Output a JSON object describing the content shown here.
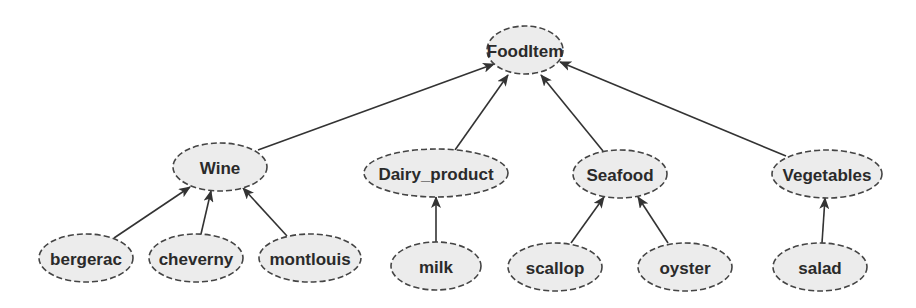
{
  "diagram": {
    "type": "class-hierarchy",
    "nodes": [
      {
        "id": "FoodItem",
        "label": "FoodItem",
        "cx": 525,
        "cy": 50,
        "rx": 38,
        "ry": 24
      },
      {
        "id": "Wine",
        "label": "Wine",
        "cx": 220,
        "cy": 167,
        "rx": 47,
        "ry": 24
      },
      {
        "id": "Dairy_product",
        "label": "Dairy_product",
        "cx": 436,
        "cy": 173,
        "rx": 72,
        "ry": 24
      },
      {
        "id": "Seafood",
        "label": "Seafood",
        "cx": 620,
        "cy": 174,
        "rx": 47,
        "ry": 24
      },
      {
        "id": "Vegetables",
        "label": "Vegetables",
        "cx": 827,
        "cy": 174,
        "rx": 55,
        "ry": 24
      },
      {
        "id": "bergerac",
        "label": "bergerac",
        "cx": 86,
        "cy": 258,
        "rx": 47,
        "ry": 24
      },
      {
        "id": "cheverny",
        "label": "cheverny",
        "cx": 196,
        "cy": 258,
        "rx": 47,
        "ry": 24
      },
      {
        "id": "montlouis",
        "label": "montlouis",
        "cx": 310,
        "cy": 258,
        "rx": 51,
        "ry": 24
      },
      {
        "id": "milk",
        "label": "milk",
        "cx": 436,
        "cy": 266,
        "rx": 45,
        "ry": 24
      },
      {
        "id": "scallop",
        "label": "scallop",
        "cx": 555,
        "cy": 267,
        "rx": 47,
        "ry": 24
      },
      {
        "id": "oyster",
        "label": "oyster",
        "cx": 685,
        "cy": 267,
        "rx": 47,
        "ry": 24
      },
      {
        "id": "salad",
        "label": "salad",
        "cx": 820,
        "cy": 267,
        "rx": 47,
        "ry": 24
      }
    ],
    "edges": [
      {
        "from": "Wine",
        "to": "FoodItem",
        "x1": 258,
        "y1": 150,
        "x2": 494,
        "y2": 64
      },
      {
        "from": "Dairy_product",
        "to": "FoodItem",
        "x1": 455,
        "y1": 150,
        "x2": 508,
        "y2": 75
      },
      {
        "from": "Seafood",
        "to": "FoodItem",
        "x1": 603,
        "y1": 151,
        "x2": 541,
        "y2": 75
      },
      {
        "from": "Vegetables",
        "to": "FoodItem",
        "x1": 786,
        "y1": 156,
        "x2": 560,
        "y2": 62
      },
      {
        "from": "bergerac",
        "to": "Wine",
        "x1": 114,
        "y1": 238,
        "x2": 190,
        "y2": 187
      },
      {
        "from": "cheverny",
        "to": "Wine",
        "x1": 201,
        "y1": 234,
        "x2": 211,
        "y2": 191
      },
      {
        "from": "montlouis",
        "to": "Wine",
        "x1": 287,
        "y1": 236,
        "x2": 243,
        "y2": 188
      },
      {
        "from": "milk",
        "to": "Dairy_product",
        "x1": 436,
        "y1": 242,
        "x2": 436,
        "y2": 197
      },
      {
        "from": "scallop",
        "to": "Seafood",
        "x1": 571,
        "y1": 243,
        "x2": 604,
        "y2": 197
      },
      {
        "from": "oyster",
        "to": "Seafood",
        "x1": 668,
        "y1": 243,
        "x2": 638,
        "y2": 197
      },
      {
        "from": "salad",
        "to": "Vegetables",
        "x1": 822,
        "y1": 243,
        "x2": 825,
        "y2": 198
      }
    ],
    "colors": {
      "node_fill": "#ececec",
      "node_stroke": "#444444",
      "edge": "#333333",
      "text": "#2a2a2a",
      "background": "#ffffff"
    }
  }
}
